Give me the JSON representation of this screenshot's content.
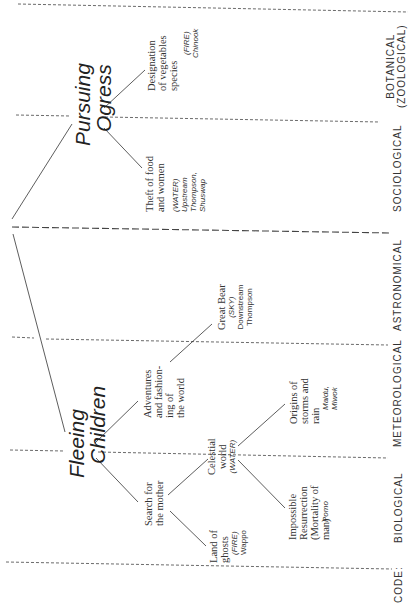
{
  "diagram": {
    "root": "",
    "branches": [
      {
        "title_line1": "Pursuing",
        "title_line2": "Ogress",
        "children": [
          {
            "lines": [
              "Designation",
              "of vegetables",
              "species"
            ],
            "element": "(FIRE)",
            "tribes": [
              "Chinook"
            ]
          },
          {
            "lines": [
              "Theft of food",
              "and women"
            ],
            "element": "(WATER)",
            "tribes": [
              "Upstream",
              "Thompson,",
              "Shuswap"
            ]
          }
        ]
      },
      {
        "title_line1": "Fleeing",
        "title_line2": "Children",
        "children": [
          {
            "lines": [
              "Adventures",
              "and fashion-",
              "ing of",
              "the world"
            ],
            "children": [
              {
                "lines": [
                  "Great Bear"
                ],
                "element": "(SKY)",
                "tribes": [
                  "Downstream",
                  "Thompson"
                ]
              }
            ]
          },
          {
            "lines": [
              "Search for",
              "the mother"
            ],
            "children": [
              {
                "lines": [
                  "Celestial",
                  "world"
                ],
                "element": "(WATER)",
                "children": [
                  {
                    "lines": [
                      "Origins of",
                      "storms and",
                      "rain"
                    ],
                    "tribes": [
                      "Maidu,",
                      "Miwok"
                    ]
                  },
                  {
                    "lines": [
                      "Impossible",
                      "Resurrection",
                      "(Mortality of",
                      "man)"
                    ],
                    "tribes": [
                      "Pomo"
                    ]
                  }
                ]
              },
              {
                "lines": [
                  "Land of",
                  "ghosts"
                ],
                "element": "(FIRE)",
                "tribes": [
                  "Wappo"
                ]
              }
            ]
          }
        ]
      }
    ],
    "codes": {
      "label": "CODE:",
      "items": [
        {
          "line1": "BOTANICAL",
          "line2": "(ZOOLOGICAL)"
        },
        {
          "line1": "SOCIOLOGICAL"
        },
        {
          "line1": "ASTRONOMICAL"
        },
        {
          "line1": "METEOROLOGICAL"
        },
        {
          "line1": "BIOLOGICAL"
        }
      ]
    }
  }
}
